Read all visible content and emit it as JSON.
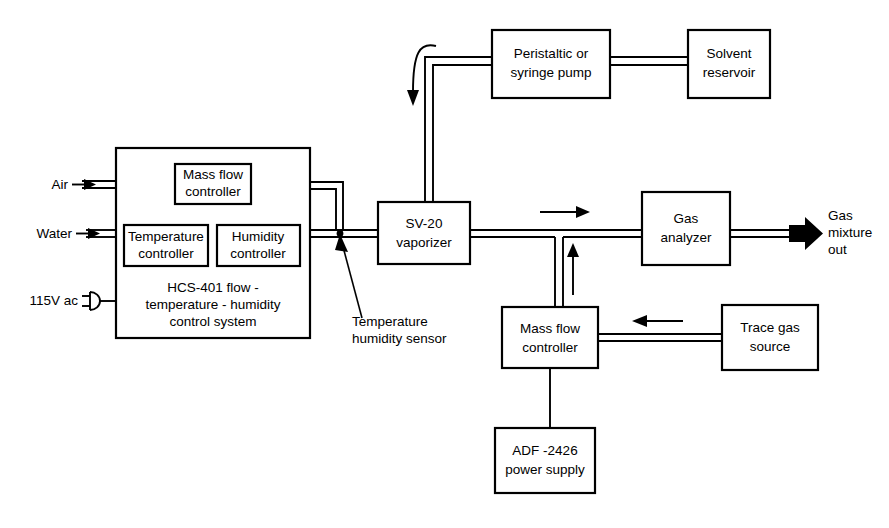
{
  "diagram": {
    "colors": {
      "line": "#000000",
      "box_fill": "#ffffff",
      "background": "#ffffff"
    },
    "boxes": {
      "hcs_system": {
        "caption_line1": "HCS-401 flow -",
        "caption_line2": "temperature - humidity",
        "caption_line3": "control system"
      },
      "mass_flow_controller_top": {
        "line1": "Mass flow",
        "line2": "controller"
      },
      "temperature_controller": {
        "line1": "Temperature",
        "line2": "controller"
      },
      "humidity_controller": {
        "line1": "Humidity",
        "line2": "controller"
      },
      "pump": {
        "line1": "Peristaltic or",
        "line2": "syringe pump"
      },
      "solvent_reservoir": {
        "line1": "Solvent",
        "line2": "reservoir"
      },
      "vaporizer": {
        "line1": "SV-20",
        "line2": "vaporizer"
      },
      "gas_analyzer": {
        "line1": "Gas",
        "line2": "analyzer"
      },
      "mass_flow_controller_bottom": {
        "line1": "Mass flow",
        "line2": "controller"
      },
      "trace_gas_source": {
        "line1": "Trace gas",
        "line2": "source"
      },
      "power_supply": {
        "line1": "ADF -2426",
        "line2": "power supply"
      }
    },
    "labels": {
      "air_inlet": "Air",
      "water_inlet": "Water",
      "mains_power": "115V ac",
      "sensor_line1": "Temperature",
      "sensor_line2": "humidity sensor",
      "outlet_line1": "Gas",
      "outlet_line2": "mixture",
      "outlet_line3": "out"
    },
    "icons": {
      "air_arrow": "arrow-right-icon",
      "water_arrow": "arrow-right-icon",
      "plug": "power-plug-icon",
      "solvent_flow_arrow": "curved-arrow-down-icon",
      "gas_flow_arrow": "arrow-right-icon",
      "trace_gas_arrow": "arrow-left-icon",
      "mix_up_arrow": "arrow-up-icon",
      "outlet_arrow": "thick-arrow-right-icon",
      "sensor_pointer": "arrow-pointer-icon"
    }
  }
}
